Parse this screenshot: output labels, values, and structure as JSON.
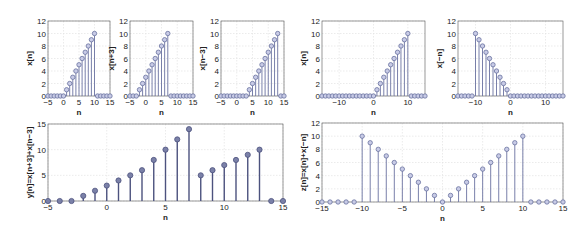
{
  "chart_data": [
    {
      "id": "p1",
      "type": "stem",
      "ylabel": "x[n]",
      "xlabel": "n",
      "xlim": [
        -5,
        15
      ],
      "ylim": [
        0,
        12
      ],
      "xticks": [
        -5,
        0,
        5,
        10,
        15
      ],
      "yticks": [
        0,
        2,
        4,
        6,
        8,
        10,
        12
      ],
      "grid": true,
      "x": [
        -5,
        -4,
        -3,
        -2,
        -1,
        0,
        1,
        2,
        3,
        4,
        5,
        6,
        7,
        8,
        9,
        10,
        11,
        12,
        13,
        14,
        15
      ],
      "y": [
        0,
        0,
        0,
        0,
        0,
        0,
        1,
        2,
        3,
        4,
        5,
        6,
        7,
        8,
        9,
        10,
        0,
        0,
        0,
        0,
        0
      ]
    },
    {
      "id": "p2",
      "type": "stem",
      "ylabel": "x[n+3]",
      "xlabel": "n",
      "xlim": [
        -5,
        15
      ],
      "ylim": [
        0,
        12
      ],
      "xticks": [
        -5,
        0,
        5,
        10,
        15
      ],
      "yticks": [
        0,
        2,
        4,
        6,
        8,
        10,
        12
      ],
      "grid": true,
      "x": [
        -5,
        -4,
        -3,
        -2,
        -1,
        0,
        1,
        2,
        3,
        4,
        5,
        6,
        7,
        8,
        9,
        10,
        11,
        12,
        13,
        14,
        15
      ],
      "y": [
        0,
        0,
        0,
        1,
        2,
        3,
        4,
        5,
        6,
        7,
        8,
        9,
        10,
        0,
        0,
        0,
        0,
        0,
        0,
        0,
        0
      ]
    },
    {
      "id": "p3",
      "type": "stem",
      "ylabel": "x[n−3]",
      "xlabel": "n",
      "xlim": [
        -5,
        15
      ],
      "ylim": [
        0,
        12
      ],
      "xticks": [
        -5,
        0,
        5,
        10,
        15
      ],
      "yticks": [
        0,
        2,
        4,
        6,
        8,
        10,
        12
      ],
      "grid": true,
      "x": [
        -5,
        -4,
        -3,
        -2,
        -1,
        0,
        1,
        2,
        3,
        4,
        5,
        6,
        7,
        8,
        9,
        10,
        11,
        12,
        13,
        14,
        15
      ],
      "y": [
        0,
        0,
        0,
        0,
        0,
        0,
        0,
        0,
        0,
        1,
        2,
        3,
        4,
        5,
        6,
        7,
        8,
        9,
        10,
        0,
        0
      ]
    },
    {
      "id": "p4",
      "type": "stem",
      "ylabel": "x[n]",
      "xlabel": "n",
      "xlim": [
        -15,
        15
      ],
      "ylim": [
        0,
        12
      ],
      "xticks": [
        -10,
        0,
        10
      ],
      "yticks": [
        0,
        2,
        4,
        6,
        8,
        10,
        12
      ],
      "grid": true,
      "x": [
        -15,
        -14,
        -13,
        -12,
        -11,
        -10,
        -9,
        -8,
        -7,
        -6,
        -5,
        -4,
        -3,
        -2,
        -1,
        0,
        1,
        2,
        3,
        4,
        5,
        6,
        7,
        8,
        9,
        10,
        11,
        12,
        13,
        14,
        15
      ],
      "y": [
        0,
        0,
        0,
        0,
        0,
        0,
        0,
        0,
        0,
        0,
        0,
        0,
        0,
        0,
        0,
        0,
        1,
        2,
        3,
        4,
        5,
        6,
        7,
        8,
        9,
        10,
        0,
        0,
        0,
        0,
        0
      ]
    },
    {
      "id": "p5",
      "type": "stem",
      "ylabel": "x[−n]",
      "xlabel": "n",
      "xlim": [
        -15,
        15
      ],
      "ylim": [
        0,
        12
      ],
      "xticks": [
        -10,
        0,
        10
      ],
      "yticks": [
        0,
        2,
        4,
        6,
        8,
        10,
        12
      ],
      "grid": true,
      "x": [
        -15,
        -14,
        -13,
        -12,
        -11,
        -10,
        -9,
        -8,
        -7,
        -6,
        -5,
        -4,
        -3,
        -2,
        -1,
        0,
        1,
        2,
        3,
        4,
        5,
        6,
        7,
        8,
        9,
        10,
        11,
        12,
        13,
        14,
        15
      ],
      "y": [
        0,
        0,
        0,
        0,
        0,
        10,
        9,
        8,
        7,
        6,
        5,
        4,
        3,
        2,
        1,
        0,
        0,
        0,
        0,
        0,
        0,
        0,
        0,
        0,
        0,
        0,
        0,
        0,
        0,
        0,
        0
      ]
    },
    {
      "id": "p6",
      "type": "stem",
      "ylabel": "y[n]=x[n+3]+x[n−3]",
      "xlabel": "n",
      "xlim": [
        -5,
        15
      ],
      "ylim": [
        0,
        15
      ],
      "xticks": [
        -5,
        0,
        5,
        10,
        15
      ],
      "yticks": [
        0,
        5,
        10,
        15
      ],
      "grid": true,
      "x": [
        -5,
        -4,
        -3,
        -2,
        -1,
        0,
        1,
        2,
        3,
        4,
        5,
        6,
        7,
        8,
        9,
        10,
        11,
        12,
        13,
        14,
        15
      ],
      "y": [
        0,
        0,
        0,
        1,
        2,
        3,
        4,
        5,
        6,
        8,
        10,
        12,
        14,
        5,
        6,
        7,
        8,
        9,
        10,
        0,
        0
      ]
    },
    {
      "id": "p7",
      "type": "stem",
      "ylabel": "z[n]=x[n]+x[−n]",
      "xlabel": "n",
      "xlim": [
        -15,
        15
      ],
      "ylim": [
        0,
        12
      ],
      "xticks": [
        -15,
        -10,
        -5,
        0,
        5,
        10,
        15
      ],
      "yticks": [
        0,
        2,
        4,
        6,
        8,
        10,
        12
      ],
      "grid": true,
      "x": [
        -15,
        -14,
        -13,
        -12,
        -11,
        -10,
        -9,
        -8,
        -7,
        -6,
        -5,
        -4,
        -3,
        -2,
        -1,
        0,
        1,
        2,
        3,
        4,
        5,
        6,
        7,
        8,
        9,
        10,
        11,
        12,
        13,
        14,
        15
      ],
      "y": [
        0,
        0,
        0,
        0,
        0,
        10,
        9,
        8,
        7,
        6,
        5,
        4,
        3,
        2,
        1,
        0,
        1,
        2,
        3,
        4,
        5,
        6,
        7,
        8,
        9,
        10,
        0,
        0,
        0,
        0,
        0
      ]
    }
  ],
  "layout": {
    "p1": {
      "box": [
        48,
        21,
        110,
        96
      ],
      "style": "light"
    },
    "p2": {
      "box": [
        130,
        21,
        193,
        96
      ],
      "style": "light"
    },
    "p3": {
      "box": [
        221,
        21,
        284,
        96
      ],
      "style": "light"
    },
    "p4": {
      "box": [
        322,
        21,
        425,
        96
      ],
      "style": "light"
    },
    "p5": {
      "box": [
        458,
        21,
        563,
        96
      ],
      "style": "light"
    },
    "p6": {
      "box": [
        48,
        124,
        283,
        201
      ],
      "style": "dark"
    },
    "p7": {
      "box": [
        322,
        123,
        563,
        202
      ],
      "style": "light"
    }
  },
  "colors": {
    "stem_light": "#6a72a0",
    "marker_fill_light": "#c8cbe6",
    "stem_dark": "#4c527e",
    "marker_fill_dark": "#7b81a8",
    "grid": "#e2e2e2",
    "axis": "#555555"
  }
}
